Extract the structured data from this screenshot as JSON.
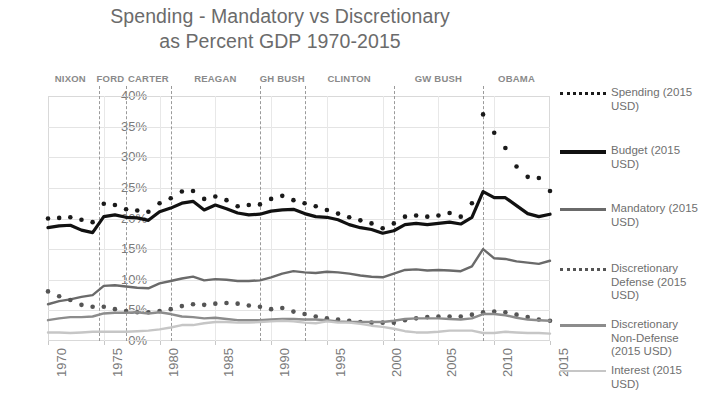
{
  "title": {
    "line1": "Spending - Mandatory vs Discretionary",
    "line2": "as Percent GDP 1970-2015"
  },
  "chart_data": {
    "type": "line",
    "title": "Spending - Mandatory vs Discretionary as Percent GDP 1970-2015",
    "xlabel": "",
    "ylabel": "",
    "xlim": [
      1970,
      2015
    ],
    "ylim": [
      0,
      40
    ],
    "grid": true,
    "legend_position": "right",
    "y_ticks": [
      "0%",
      "5%",
      "10%",
      "15%",
      "20%",
      "25%",
      "30%",
      "35%",
      "40%"
    ],
    "y_tick_values": [
      0,
      5,
      10,
      15,
      20,
      25,
      30,
      35,
      40
    ],
    "x_ticks": [
      "1970",
      "1975",
      "1980",
      "1985",
      "1990",
      "1995",
      "2000",
      "2005",
      "2010",
      "2015"
    ],
    "x_tick_values": [
      1970,
      1975,
      1980,
      1985,
      1990,
      1995,
      2000,
      2005,
      2010,
      2015
    ],
    "x": [
      1970,
      1971,
      1972,
      1973,
      1974,
      1975,
      1976,
      1977,
      1978,
      1979,
      1980,
      1981,
      1982,
      1983,
      1984,
      1985,
      1986,
      1987,
      1988,
      1989,
      1990,
      1991,
      1992,
      1993,
      1994,
      1995,
      1996,
      1997,
      1998,
      1999,
      2000,
      2001,
      2002,
      2003,
      2004,
      2005,
      2006,
      2007,
      2008,
      2009,
      2010,
      2011,
      2012,
      2013,
      2014,
      2015
    ],
    "annotations": [
      {
        "label": "NIXON",
        "x": 1972.0,
        "divider_x": 1974.6
      },
      {
        "label": "FORD",
        "x": 1975.6,
        "divider_x": 1977.0
      },
      {
        "label": "CARTER",
        "x": 1979.0,
        "divider_x": 1981.0
      },
      {
        "label": "REAGAN",
        "x": 1985.0,
        "divider_x": 1989.0
      },
      {
        "label": "GH BUSH",
        "x": 1991.0,
        "divider_x": 1993.0
      },
      {
        "label": "CLINTON",
        "x": 1997.0,
        "divider_x": 2001.0
      },
      {
        "label": "GW BUSH",
        "x": 2005.0,
        "divider_x": 2009.0
      },
      {
        "label": "OBAMA",
        "x": 2012.0,
        "divider_x": null
      }
    ],
    "series": [
      {
        "name": "Spending (2015 USD)",
        "style": "dotted",
        "color": "#1a1a1a",
        "values": [
          20.0,
          20.1,
          20.2,
          19.8,
          19.4,
          22.4,
          22.2,
          21.5,
          21.3,
          21.1,
          22.5,
          23.3,
          24.4,
          24.5,
          23.2,
          23.6,
          23.0,
          22.0,
          22.2,
          22.3,
          23.2,
          23.7,
          23.0,
          22.5,
          22.0,
          21.4,
          20.8,
          20.2,
          19.7,
          19.2,
          18.4,
          19.2,
          20.3,
          20.5,
          20.3,
          20.5,
          20.9,
          20.3,
          22.5,
          37.0,
          34.0,
          31.5,
          28.5,
          26.8,
          26.6,
          24.5
        ]
      },
      {
        "name": "Budget (2015 USD)",
        "style": "solid",
        "color": "#111111",
        "values": [
          18.5,
          18.8,
          18.9,
          18.1,
          17.7,
          20.3,
          20.6,
          20.2,
          20.1,
          19.7,
          21.1,
          21.7,
          22.5,
          22.8,
          21.4,
          22.2,
          21.6,
          20.9,
          20.6,
          20.7,
          21.2,
          21.4,
          21.5,
          20.8,
          20.3,
          20.2,
          19.8,
          19.0,
          18.5,
          18.2,
          17.6,
          18.0,
          19.0,
          19.2,
          19.0,
          19.2,
          19.4,
          19.1,
          20.2,
          24.4,
          23.4,
          23.4,
          22.1,
          20.8,
          20.3,
          20.7
        ]
      },
      {
        "name": "Mandatory (2015 USD)",
        "style": "solid",
        "color": "#6a6a6a",
        "values": [
          6.0,
          6.5,
          6.8,
          7.2,
          7.5,
          9.0,
          9.1,
          8.9,
          8.7,
          8.6,
          9.4,
          9.8,
          10.2,
          10.5,
          9.9,
          10.1,
          10.0,
          9.8,
          9.8,
          9.9,
          10.4,
          11.0,
          11.4,
          11.2,
          11.1,
          11.3,
          11.2,
          11.0,
          10.7,
          10.5,
          10.4,
          11.0,
          11.6,
          11.7,
          11.5,
          11.6,
          11.5,
          11.4,
          12.2,
          15.0,
          13.5,
          13.4,
          13.0,
          12.8,
          12.6,
          13.1
        ]
      },
      {
        "name": "Discretionary Defense (2015 USD)",
        "style": "dotted",
        "color": "#555555",
        "values": [
          8.1,
          7.3,
          6.7,
          5.9,
          5.6,
          5.6,
          5.2,
          4.9,
          4.7,
          4.7,
          4.9,
          5.2,
          5.7,
          6.0,
          5.9,
          6.1,
          6.2,
          6.1,
          5.8,
          5.6,
          5.2,
          5.4,
          4.8,
          4.4,
          4.0,
          3.7,
          3.5,
          3.3,
          3.1,
          3.0,
          3.0,
          3.0,
          3.4,
          3.7,
          3.9,
          4.0,
          4.0,
          4.0,
          4.3,
          4.7,
          4.8,
          4.7,
          4.3,
          3.9,
          3.5,
          3.3
        ]
      },
      {
        "name": "Discretionary Non-Defense (2015 USD)",
        "style": "solid",
        "color": "#8c8c8c",
        "values": [
          3.4,
          3.7,
          3.9,
          3.9,
          4.0,
          4.5,
          4.6,
          4.6,
          4.7,
          4.5,
          4.7,
          4.4,
          4.0,
          3.9,
          3.7,
          3.8,
          3.6,
          3.4,
          3.4,
          3.4,
          3.5,
          3.6,
          3.6,
          3.5,
          3.5,
          3.4,
          3.2,
          3.1,
          3.1,
          3.1,
          3.1,
          3.3,
          3.6,
          3.7,
          3.7,
          3.7,
          3.6,
          3.5,
          3.7,
          4.4,
          4.4,
          4.2,
          3.8,
          3.5,
          3.4,
          3.3
        ]
      },
      {
        "name": "Interest (2015 USD)",
        "style": "solid",
        "color": "#c6c6c6",
        "values": [
          1.4,
          1.4,
          1.3,
          1.4,
          1.5,
          1.5,
          1.5,
          1.5,
          1.6,
          1.7,
          1.9,
          2.2,
          2.6,
          2.6,
          2.9,
          3.1,
          3.1,
          3.0,
          3.0,
          3.1,
          3.2,
          3.3,
          3.2,
          3.0,
          2.9,
          3.2,
          3.0,
          3.0,
          2.8,
          2.5,
          2.3,
          2.0,
          1.6,
          1.4,
          1.4,
          1.5,
          1.7,
          1.7,
          1.7,
          1.3,
          1.3,
          1.5,
          1.4,
          1.3,
          1.3,
          1.2
        ]
      }
    ]
  },
  "legend": {
    "items": [
      {
        "label": "Spending (2015 USD)",
        "style": "dotted",
        "color": "#1a1a1a"
      },
      {
        "label": "Budget (2015 USD)",
        "style": "solid",
        "color": "#111111"
      },
      {
        "label": "Mandatory (2015 USD)",
        "style": "solid",
        "color": "#6a6a6a"
      },
      {
        "label": "Discretionary Defense (2015 USD)",
        "style": "dotted",
        "color": "#555555"
      },
      {
        "label": "Discretionary Non-Defense (2015 USD)",
        "style": "solid",
        "color": "#8c8c8c"
      },
      {
        "label": "Interest (2015 USD)",
        "style": "solid",
        "color": "#c6c6c6"
      }
    ]
  }
}
